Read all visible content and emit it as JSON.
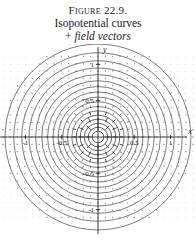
{
  "caption": {
    "figure_number": "Figure 22.9.",
    "line2": "Isopotential curves",
    "line3_prefix": "+ ",
    "line3_italic": "field vectors"
  },
  "axes": {
    "x_label": "x",
    "y_label": "y",
    "x_ticks": [
      {
        "value": -1,
        "label": "-1"
      },
      {
        "value": -0.5,
        "label": "-0.5"
      },
      {
        "value": 0.5,
        "label": "0.5"
      },
      {
        "value": 1,
        "label": "1"
      }
    ],
    "y_ticks": [
      {
        "value": -1,
        "label": "-1"
      },
      {
        "value": -0.5,
        "label": "-0.5"
      },
      {
        "value": 0.5,
        "label": "0.5"
      },
      {
        "value": 1,
        "label": "1"
      }
    ]
  },
  "colors": {
    "curve": "#2b2b2b",
    "axis": "#111111",
    "vector": "#333333",
    "grid_dot": "#b9b9b9",
    "background": "#ffffff"
  },
  "chart_data": {
    "type": "contour",
    "title": "Isopotential curves + field vectors",
    "xlabel": "x",
    "ylabel": "y",
    "xlim": [
      -1.35,
      1.35
    ],
    "ylim": [
      -1.15,
      1.15
    ],
    "grid": true,
    "legend": "none",
    "center": [
      0,
      0
    ],
    "contour_radii": [
      0.08,
      0.135,
      0.19,
      0.245,
      0.3,
      0.36,
      0.42,
      0.485,
      0.55,
      0.62,
      0.695,
      0.775,
      0.86,
      0.95,
      1.05,
      1.16,
      1.28
    ],
    "contour_levels": [
      12.5,
      7.4,
      5.26,
      4.08,
      3.33,
      2.78,
      2.38,
      2.06,
      1.82,
      1.61,
      1.44,
      1.29,
      1.16,
      1.05,
      0.95,
      0.86,
      0.78
    ],
    "vector_field": {
      "kind": "radial",
      "direction": "outward",
      "grid_spacing": 0.1,
      "magnitude_rule": "1/r^2 (clipped)"
    }
  }
}
